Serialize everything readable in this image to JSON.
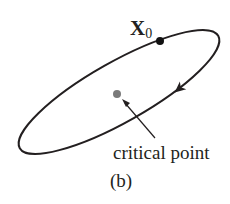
{
  "figure": {
    "panel_label": "(b)",
    "initial_point": {
      "label_main": "X",
      "label_sub": "0"
    },
    "critical_point": {
      "label": "critical point"
    },
    "orbit": {
      "shape": "ellipse",
      "direction": "clockwise"
    },
    "colors": {
      "orbit": "#231f20",
      "initial_point": "#111111",
      "critical_point": "#7a7a7a",
      "text": "#231f20"
    }
  }
}
